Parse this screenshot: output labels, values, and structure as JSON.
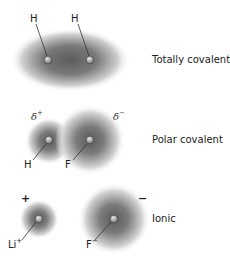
{
  "rows": [
    {
      "type_label": "Totally covalent",
      "atoms": [
        {
          "symbol": "H",
          "charge": ""
        },
        {
          "symbol": "H",
          "charge": ""
        }
      ]
    },
    {
      "type_label": "Polar covalent",
      "partial_charges": {
        "left": "δ",
        "left_sign": "+",
        "right": "δ",
        "right_sign": "−"
      },
      "atoms": [
        {
          "symbol": "H",
          "charge": ""
        },
        {
          "symbol": "F",
          "charge": ""
        }
      ]
    },
    {
      "type_label": "Ionic",
      "charges": {
        "left": "+",
        "right": "−"
      },
      "atoms": [
        {
          "symbol": "Li",
          "charge": "+"
        },
        {
          "symbol": "F",
          "charge": "−"
        }
      ]
    }
  ],
  "colors": {
    "cloud": "#6e6e6e",
    "nucleus": "#9a9a9a",
    "line": "#333333"
  }
}
